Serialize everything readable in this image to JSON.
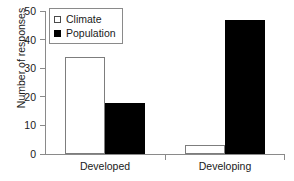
{
  "chart_data": {
    "type": "bar",
    "title": "",
    "subtitle": "",
    "xlabel": "",
    "ylabel": "Number of responses",
    "categories": [
      "Developed",
      "Developing"
    ],
    "series": [
      {
        "name": "Climate",
        "values": [
          34,
          3
        ],
        "style": "open",
        "color": "#ffffff"
      },
      {
        "name": "Population",
        "values": [
          18,
          47
        ],
        "style": "filled",
        "color": "#000000"
      }
    ],
    "ylim": [
      0,
      50
    ],
    "ytick_values": [
      0,
      10,
      20,
      30,
      40,
      50
    ],
    "ytick_labels": [
      "0",
      "10",
      "20",
      "30",
      "40",
      "50"
    ],
    "grid": false,
    "legend_position": "top-left",
    "legend_entries": [
      "Climate",
      "Population"
    ]
  },
  "axes": {
    "y_title": "Number of responses",
    "y_ticks": [
      "50",
      "40",
      "30",
      "20",
      "10",
      "0"
    ],
    "x_labels": [
      "Developed",
      "Developing"
    ]
  },
  "legend": {
    "entries": [
      {
        "label": "Climate",
        "marker": "open-square-marker"
      },
      {
        "label": "Population",
        "marker": "filled-square-marker"
      }
    ]
  }
}
